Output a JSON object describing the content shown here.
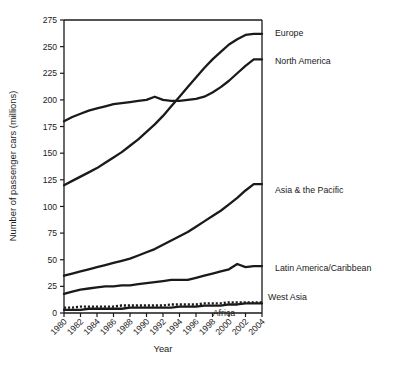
{
  "chart_data": {
    "type": "line",
    "title": "",
    "xlabel": "Year",
    "ylabel": "Number of passenger cars (millions)",
    "xlim": [
      1980,
      2004
    ],
    "ylim": [
      0,
      275
    ],
    "ytick_step": 25,
    "xtick_step": 2,
    "grid": false,
    "legend_position": "right-inline-labels",
    "xticks": [
      "1980",
      "1982",
      "1984",
      "1986",
      "1988",
      "1990",
      "1992",
      "1994",
      "1996",
      "1998",
      "2000",
      "2002",
      "2004"
    ],
    "yticks": [
      "0",
      "25",
      "50",
      "75",
      "100",
      "125",
      "150",
      "175",
      "200",
      "225",
      "250",
      "275"
    ],
    "x": [
      1980,
      1981,
      1982,
      1983,
      1984,
      1985,
      1986,
      1987,
      1988,
      1989,
      1990,
      1991,
      1992,
      1993,
      1994,
      1995,
      1996,
      1997,
      1998,
      1999,
      2000,
      2001,
      2002,
      2003,
      2004
    ],
    "series": [
      {
        "name": "Europe",
        "style": "solid",
        "values": [
          120,
          124,
          128,
          132,
          136,
          141,
          146,
          151,
          157,
          163,
          170,
          177,
          185,
          194,
          203,
          212,
          221,
          230,
          238,
          245,
          252,
          257,
          261,
          262,
          262
        ]
      },
      {
        "name": "North America",
        "style": "solid",
        "values": [
          180,
          184,
          187,
          190,
          192,
          194,
          196,
          197,
          198,
          199,
          200,
          203,
          200,
          199,
          199,
          200,
          201,
          203,
          207,
          212,
          218,
          225,
          232,
          238,
          238
        ]
      },
      {
        "name": "Asia & the Pacific",
        "style": "solid",
        "values": [
          35,
          37,
          39,
          41,
          43,
          45,
          47,
          49,
          51,
          54,
          57,
          60,
          64,
          68,
          72,
          76,
          81,
          86,
          91,
          96,
          102,
          108,
          115,
          121,
          121
        ]
      },
      {
        "name": "Latin America/Caribbean",
        "style": "solid",
        "values": [
          18,
          20,
          22,
          23,
          24,
          25,
          25,
          26,
          26,
          27,
          28,
          29,
          30,
          31,
          31,
          31,
          33,
          35,
          37,
          39,
          41,
          46,
          43,
          44,
          44
        ]
      },
      {
        "name": "West Asia",
        "style": "dotted",
        "values": [
          5,
          5,
          6,
          6,
          6,
          6,
          6,
          7,
          7,
          7,
          7,
          7,
          7,
          8,
          8,
          8,
          8,
          9,
          9,
          9,
          10,
          10,
          10,
          10,
          10
        ]
      },
      {
        "name": "Africa",
        "style": "solid",
        "values": [
          3,
          3,
          3,
          4,
          4,
          4,
          4,
          4,
          5,
          5,
          5,
          5,
          5,
          5,
          6,
          6,
          6,
          7,
          7,
          7,
          8,
          8,
          9,
          9,
          9
        ]
      }
    ],
    "annotations": [
      {
        "label": "Europe",
        "x": 275,
        "y": 33
      },
      {
        "label": "North America",
        "x": 275,
        "y": 61
      },
      {
        "label": "Asia & the Pacific",
        "x": 275,
        "y": 190
      },
      {
        "label": "Latin America/Caribbean",
        "x": 275,
        "y": 268
      },
      {
        "label": "West Asia",
        "x": 268,
        "y": 297
      },
      {
        "label": "Africa",
        "x": 224,
        "y": 313
      }
    ],
    "colors": {
      "line": "#1a1a1a",
      "axis": "#1a1a1a",
      "background": "#ffffff"
    }
  }
}
